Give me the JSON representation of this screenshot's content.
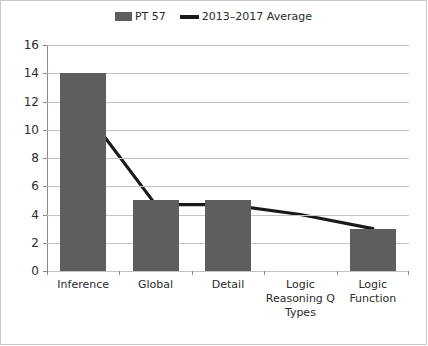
{
  "chart_data": {
    "type": "bar",
    "title": "",
    "xlabel": "",
    "ylabel": "",
    "categories": [
      "Inference",
      "Global",
      "Detail",
      "Logic Reasoning Q Types",
      "Logic Function"
    ],
    "ylim": [
      0,
      16
    ],
    "ytick_step": 2,
    "yticks": [
      0,
      2,
      4,
      6,
      8,
      10,
      12,
      14,
      16
    ],
    "grid": true,
    "grid_orientation": "horizontal",
    "legend_position": "top-center",
    "series": [
      {
        "name": "PT 57",
        "type": "bar",
        "color": "#5e5e5e",
        "values": [
          14,
          5,
          5,
          0,
          3
        ]
      },
      {
        "name": "2013–2017 Average",
        "type": "line",
        "color": "#1a1a1a",
        "values": [
          11.5,
          4.7,
          4.7,
          4.0,
          3.0
        ]
      }
    ]
  },
  "legend": {
    "entries": [
      {
        "label": "PT 57",
        "marker": "bar-swatch",
        "color": "#5e5e5e"
      },
      {
        "label": "2013–2017 Average",
        "marker": "line-swatch",
        "color": "#1a1a1a"
      }
    ]
  },
  "axis": {
    "y_labels": [
      "16",
      "14",
      "12",
      "10",
      "8",
      "6",
      "4",
      "2",
      "0"
    ],
    "x_labels": [
      "Inference",
      "Global",
      "Detail",
      "Logic Reasoning Q Types",
      "Logic Function"
    ]
  }
}
